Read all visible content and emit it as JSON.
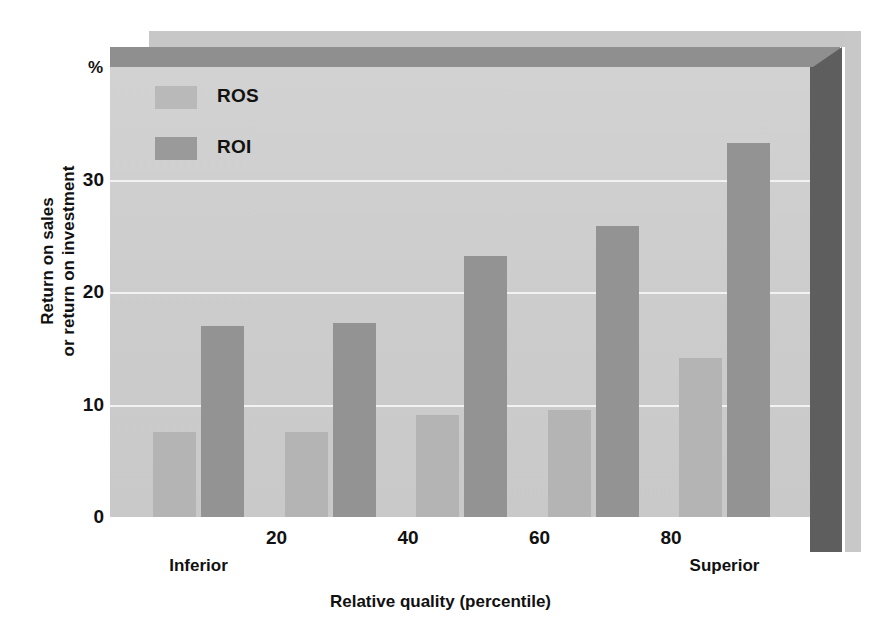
{
  "chart_data": {
    "type": "bar",
    "title": "",
    "xlabel": "Relative quality (percentile)",
    "ylabel_lines": [
      "Return on sales",
      "or return on investment"
    ],
    "yunit": "%",
    "ylim": [
      0,
      40
    ],
    "yticks": [
      0,
      10,
      20,
      30
    ],
    "ytick_labels": [
      "0",
      "10",
      "20",
      "30"
    ],
    "xticks": [
      20,
      40,
      60,
      80
    ],
    "xtick_labels": [
      "20",
      "40",
      "60",
      "80"
    ],
    "x_end_captions": {
      "left": "Inferior",
      "right": "Superior"
    },
    "grid": true,
    "legend_position": "top-left",
    "categories": [
      "0-20",
      "20-40",
      "40-60",
      "60-80",
      "80-100"
    ],
    "series": [
      {
        "name": "ROS",
        "color": "#b4b4b4",
        "values": [
          7.6,
          7.6,
          9.1,
          9.5,
          14.2
        ]
      },
      {
        "name": "ROI",
        "color": "#939393",
        "values": [
          17.0,
          17.3,
          23.2,
          25.9,
          33.3
        ]
      }
    ]
  },
  "legend": {
    "items": [
      {
        "label": "ROS",
        "swatch_name": "legend-swatch-ros"
      },
      {
        "label": "ROI",
        "swatch_name": "legend-swatch-roi"
      }
    ]
  },
  "axes": {
    "percent_symbol": "%",
    "y_title_line1": "Return on sales",
    "y_title_line2": "or return on investment",
    "x_title": "Relative quality (percentile)",
    "y_tick_labels": [
      "30",
      "20",
      "10",
      "0"
    ],
    "x_tick_labels": [
      "20",
      "40",
      "60",
      "80"
    ],
    "x_left_caption": "Inferior",
    "x_right_caption": "Superior"
  },
  "colors": {
    "panel": "#cfcfcf",
    "gridline": "#f2f2f2",
    "ros_bar": "#b4b4b4",
    "roi_bar": "#939393",
    "top_face": "#8f8f8f",
    "side_wall": "#5e5e5e",
    "shelf": "#c7c7c7",
    "text": "#111111"
  }
}
